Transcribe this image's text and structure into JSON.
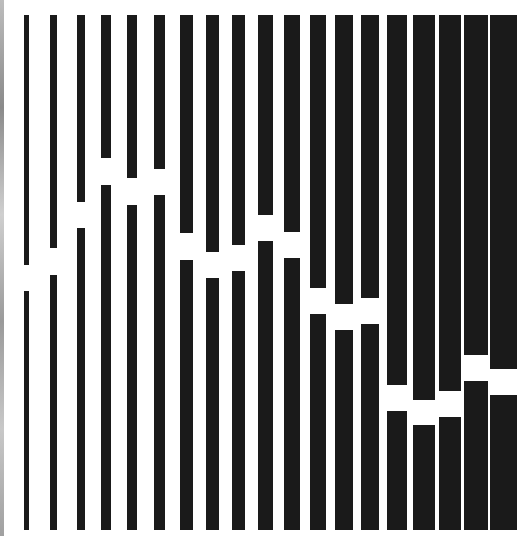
{
  "artwork": {
    "description": "Op-art composition of vertical black bars, each broken by a horizontal white gap at varying heights; bars widen from left to right",
    "bar_color": "#1a1a1a",
    "background_color": "#ffffff",
    "top": 15,
    "bottom": 530,
    "bars": [
      {
        "x": 24,
        "w": 5,
        "gap_top": 265,
        "gap_bottom": 291
      },
      {
        "x": 50,
        "w": 7,
        "gap_top": 248,
        "gap_bottom": 275
      },
      {
        "x": 77,
        "w": 8,
        "gap_top": 202,
        "gap_bottom": 228
      },
      {
        "x": 101,
        "w": 10,
        "gap_top": 158,
        "gap_bottom": 185
      },
      {
        "x": 127,
        "w": 10,
        "gap_top": 178,
        "gap_bottom": 205
      },
      {
        "x": 154,
        "w": 11,
        "gap_top": 169,
        "gap_bottom": 195
      },
      {
        "x": 180,
        "w": 13,
        "gap_top": 233,
        "gap_bottom": 260
      },
      {
        "x": 206,
        "w": 13,
        "gap_top": 252,
        "gap_bottom": 278
      },
      {
        "x": 232,
        "w": 13,
        "gap_top": 245,
        "gap_bottom": 271
      },
      {
        "x": 258,
        "w": 15,
        "gap_top": 215,
        "gap_bottom": 241
      },
      {
        "x": 284,
        "w": 16,
        "gap_top": 232,
        "gap_bottom": 258
      },
      {
        "x": 310,
        "w": 16,
        "gap_top": 288,
        "gap_bottom": 314
      },
      {
        "x": 335,
        "w": 18,
        "gap_top": 304,
        "gap_bottom": 330
      },
      {
        "x": 361,
        "w": 18,
        "gap_top": 298,
        "gap_bottom": 324
      },
      {
        "x": 387,
        "w": 20,
        "gap_top": 385,
        "gap_bottom": 411
      },
      {
        "x": 413,
        "w": 22,
        "gap_top": 400,
        "gap_bottom": 425
      },
      {
        "x": 439,
        "w": 22,
        "gap_top": 391,
        "gap_bottom": 417
      },
      {
        "x": 464,
        "w": 24,
        "gap_top": 355,
        "gap_bottom": 381
      },
      {
        "x": 490,
        "w": 27,
        "gap_top": 369,
        "gap_bottom": 395
      }
    ]
  }
}
